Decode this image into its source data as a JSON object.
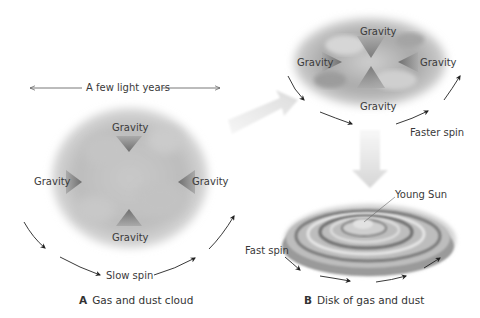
{
  "panel_a": {
    "scale_label": "A few light years",
    "gravity_top": "Gravity",
    "gravity_left": "Gravity",
    "gravity_right": "Gravity",
    "gravity_bottom": "Gravity",
    "spin_label": "Slow spin",
    "caption_letter": "A",
    "caption_text": "Gas and dust cloud"
  },
  "panel_mid": {
    "gravity_top": "Gravity",
    "gravity_left": "Gravity",
    "gravity_right": "Gravity",
    "gravity_bottom": "Gravity",
    "spin_label": "Faster spin"
  },
  "panel_b": {
    "sun_label": "Young Sun",
    "spin_label": "Fast spin",
    "caption_letter": "B",
    "caption_text": "Disk of gas and dust"
  },
  "colors": {
    "cloud": "#b8b8b8",
    "arrow_gray": "#8a8a8a",
    "transition_arrow": "#e2e2e2",
    "text": "#333333"
  }
}
